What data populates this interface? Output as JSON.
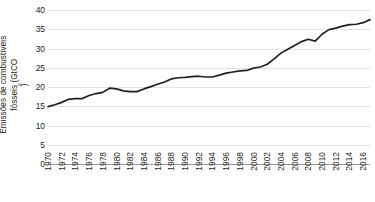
{
  "chart_data": {
    "type": "line",
    "title": "",
    "subtitle": "",
    "xlabel": "",
    "ylabel": "Emissões de combustíveis fósseis (GtCO2)",
    "ylabel_line1": "Emissões de combustíveis",
    "ylabel_line2_prefix": "fósseis (GtCO",
    "ylabel_line2_subscript": "2",
    "ylabel_line2_suffix": ")",
    "ylim": [
      0,
      40
    ],
    "xlim": [
      1970,
      2017
    ],
    "y_ticks": [
      0,
      5,
      10,
      15,
      20,
      25,
      30,
      35,
      40
    ],
    "y_tick_labels": [
      "0",
      "5",
      "10",
      "15",
      "20",
      "25",
      "30",
      "35",
      "40"
    ],
    "x_tick_labels": [
      "1970",
      "1972",
      "1974",
      "1976",
      "1978",
      "1980",
      "1982",
      "1984",
      "1986",
      "1988",
      "1990",
      "1992",
      "1994",
      "1996",
      "1998",
      "2000",
      "2002",
      "2004",
      "2006",
      "2008",
      "2010",
      "2012",
      "2014",
      "2016"
    ],
    "x_tick_values": [
      1970,
      1972,
      1974,
      1976,
      1978,
      1980,
      1982,
      1984,
      1986,
      1988,
      1990,
      1992,
      1994,
      1996,
      1998,
      2000,
      2002,
      2004,
      2006,
      2008,
      2010,
      2012,
      2014,
      2016
    ],
    "grid": true,
    "grid_axis": "y",
    "legend": false,
    "legend_position": "none",
    "line_color": "#231f20",
    "grid_color": "#e3e3e3",
    "axis_color": "#9a9a9a",
    "units": "GtCO2",
    "x": [
      1970,
      1971,
      1972,
      1973,
      1974,
      1975,
      1976,
      1977,
      1978,
      1979,
      1980,
      1981,
      1982,
      1983,
      1984,
      1985,
      1986,
      1987,
      1988,
      1989,
      1990,
      1991,
      1992,
      1993,
      1994,
      1995,
      1996,
      1997,
      1998,
      1999,
      2000,
      2001,
      2002,
      2003,
      2004,
      2005,
      2006,
      2007,
      2008,
      2009,
      2010,
      2011,
      2012,
      2013,
      2014,
      2015,
      2016,
      2017
    ],
    "values": [
      14.9,
      15.4,
      16.0,
      16.8,
      17.0,
      17.0,
      17.8,
      18.3,
      18.6,
      19.7,
      19.5,
      19.0,
      18.8,
      18.8,
      19.5,
      20.1,
      20.7,
      21.3,
      22.1,
      22.4,
      22.5,
      22.7,
      22.8,
      22.6,
      22.6,
      23.1,
      23.6,
      23.9,
      24.2,
      24.3,
      24.9,
      25.2,
      25.9,
      27.3,
      28.8,
      29.8,
      30.8,
      31.8,
      32.4,
      31.9,
      33.7,
      34.9,
      35.3,
      35.8,
      36.2,
      36.3,
      36.7,
      37.5
    ],
    "annotations": [],
    "series": [
      {
        "name": "Emissões de combustíveis fósseis",
        "color": "#231f20",
        "values": [
          14.9,
          15.4,
          16.0,
          16.8,
          17.0,
          17.0,
          17.8,
          18.3,
          18.6,
          19.7,
          19.5,
          19.0,
          18.8,
          18.8,
          19.5,
          20.1,
          20.7,
          21.3,
          22.1,
          22.4,
          22.5,
          22.7,
          22.8,
          22.6,
          22.6,
          23.1,
          23.6,
          23.9,
          24.2,
          24.3,
          24.9,
          25.2,
          25.9,
          27.3,
          28.8,
          29.8,
          30.8,
          31.8,
          32.4,
          31.9,
          33.7,
          34.9,
          35.3,
          35.8,
          36.2,
          36.3,
          36.7,
          37.5
        ]
      }
    ]
  }
}
